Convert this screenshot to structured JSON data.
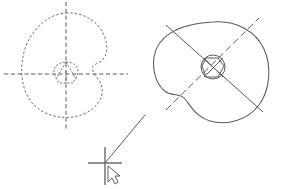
{
  "canvas": {
    "name": "drawing-canvas",
    "width": 284,
    "height": 189,
    "background_color": "#ffffff",
    "title": "Geometry sketch canvas",
    "description": "Two irregular closed profiles with construction centerlines and a crosshair pick point with mouse cursor"
  },
  "palette": {
    "dashed_stroke": "#6e6e72",
    "axis_stroke": "#5d5d63",
    "solid_stroke": "#5a5a60",
    "marker_stroke": "#6a6a70",
    "cursor_outline": "#4e4e54",
    "cursor_fill": "#ffffff"
  },
  "figures": [
    {
      "id": "left-figure",
      "label": "Left profile (hidden / dashed construction)",
      "line_style": "dashed",
      "center": {
        "x": 66,
        "y": 74
      },
      "outline_path": "M 66 13 C 84 12 100 22 105 38 C 110 53 104 61 96 64 C 88 67 95 75 100 82 C 106 92 100 106 86 113 C 70 121 48 118 35 106 C 22 94 19 72 24 52 C 30 30 48 14 66 13 Z",
      "axes": [
        {
          "id": "vertical-axis",
          "x1": 66,
          "y1": 2,
          "x2": 66,
          "y2": 131,
          "orientation": "vertical"
        },
        {
          "id": "horizontal-axis",
          "x1": 4,
          "y1": 74,
          "x2": 128,
          "y2": 74,
          "orientation": "horizontal"
        }
      ],
      "hub": {
        "id": "left-hub",
        "outline_path": "M 66 62 C 73 62 78 66 78 71 C 78 76 74 80 73 83 L 59 83 C 58 80 54 76 54 71 C 54 66 59 62 66 62 Z",
        "spokes": [
          {
            "x1": 66,
            "y1": 62,
            "x2": 56,
            "y2": 79
          },
          {
            "x1": 66,
            "y1": 62,
            "x2": 76,
            "y2": 79
          },
          {
            "x1": 66,
            "y1": 71,
            "x2": 66,
            "y2": 83
          }
        ]
      }
    },
    {
      "id": "right-figure",
      "label": "Right profile (visible / solid)",
      "line_style": "solid",
      "center": {
        "x": 213,
        "y": 68
      },
      "outline_path": "M 213 22 C 235 20 256 31 264 49 C 272 67 270 90 259 105 C 248 120 227 126 210 121 C 196 117 190 105 185 99 C 180 93 172 96 166 92 C 157 86 152 72 154 57 C 157 38 175 24 213 22 Z",
      "axes": [
        {
          "id": "diagonal-axis-descending",
          "style": "solid",
          "x1": 166,
          "y1": 25,
          "x2": 263,
          "y2": 112
        },
        {
          "id": "diagonal-axis-ascending",
          "style": "centerline",
          "x1": 166,
          "y1": 110,
          "x2": 259,
          "y2": 18
        }
      ],
      "hub": {
        "id": "right-hub",
        "circle": {
          "cx": 213,
          "cy": 67,
          "r": 12
        },
        "facets_path": "M 206 58 L 218 58 L 224 66 L 218 77 L 206 77 L 202 66 Z",
        "cross": [
          {
            "x1": 204,
            "y1": 58,
            "x2": 223,
            "y2": 77
          },
          {
            "x1": 223,
            "y1": 58,
            "x2": 204,
            "y2": 77
          }
        ]
      }
    }
  ],
  "pick_marker": {
    "id": "crosshair-pick-point",
    "label": "Crosshair pick point",
    "center": {
      "x": 105,
      "y": 163
    },
    "vertical": {
      "x1": 105,
      "y1": 147,
      "x2": 105,
      "y2": 185
    },
    "horizontal": {
      "x1": 88,
      "y1": 163,
      "x2": 122,
      "y2": 163
    },
    "leader_line": {
      "x1": 105,
      "y1": 163,
      "x2": 145,
      "y2": 115
    }
  },
  "cursor": {
    "id": "mouse-pointer",
    "label": "Mouse pointer",
    "position": {
      "x": 108,
      "y": 166
    },
    "glyph_path": "M 108 166 L 108 182 L 112 178 L 115 184 L 118 182 L 115 176 L 120 176 Z"
  }
}
